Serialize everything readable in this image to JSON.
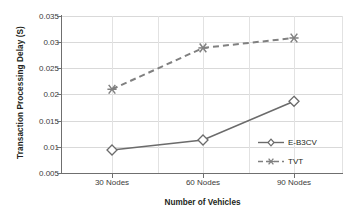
{
  "chart_data": {
    "type": "line",
    "title": "",
    "xlabel": "Number of Vehicles",
    "ylabel": "Transaction Processing Delay (S)",
    "categories": [
      "30 Nodes",
      "60 Nodes",
      "90 Nodes"
    ],
    "ylim": [
      0.005,
      0.035
    ],
    "yticks": [
      "0.005",
      "0.01",
      "0.015",
      "0.02",
      "0.025",
      "0.03",
      "0.035"
    ],
    "ytick_values": [
      0.005,
      0.01,
      0.015,
      0.02,
      0.025,
      0.03,
      0.035
    ],
    "grid": true,
    "legend_position": "inside-right",
    "series": [
      {
        "name": "E-B3CV",
        "values": [
          0.0094,
          0.0113,
          0.0187
        ],
        "color": "#6b6b6b",
        "line_style": "solid",
        "marker": "diamond-open"
      },
      {
        "name": "TVT",
        "values": [
          0.021,
          0.0289,
          0.0308
        ],
        "color": "#808080",
        "line_style": "dashed",
        "marker": "asterisk"
      }
    ]
  },
  "legend": {
    "items": [
      {
        "label": "E-B3CV"
      },
      {
        "label": "TVT"
      }
    ]
  },
  "colors": {
    "axis": "#6f6f6f",
    "grid": "#d9d9d9",
    "text": "#231f20",
    "series_1": "#6b6b6b",
    "series_2": "#808080",
    "background": "#ffffff"
  }
}
